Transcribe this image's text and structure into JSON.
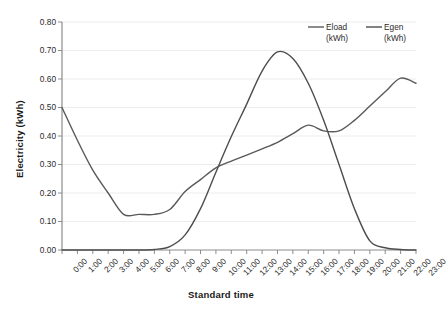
{
  "chart_data": {
    "type": "line",
    "title": "",
    "xlabel": "Standard time",
    "ylabel": "Electricity  (kWh)",
    "xlim": [
      0,
      23
    ],
    "ylim": [
      0.0,
      0.8
    ],
    "ytick_step": 0.1,
    "grid": true,
    "grid_axis": "y",
    "legend_position": "top-right",
    "categories": [
      "0:00",
      "1:00",
      "2:00",
      "3:00",
      "4:00",
      "5:00",
      "6:00",
      "7:00",
      "8:00",
      "9:00",
      "10:00",
      "11:00",
      "12:00",
      "13:00",
      "14:00",
      "15:00",
      "16:00",
      "17:00",
      "18:00",
      "19:00",
      "20:00",
      "21:00",
      "22:00",
      "23:00"
    ],
    "ytick_labels": [
      "0.00",
      "0.10",
      "0.20",
      "0.30",
      "0.40",
      "0.50",
      "0.60",
      "0.70",
      "0.80"
    ],
    "ytick_values": [
      0.0,
      0.1,
      0.2,
      0.3,
      0.4,
      0.5,
      0.6,
      0.7,
      0.8
    ],
    "series": [
      {
        "name": "Eload",
        "unit": "(kWh)",
        "color": "#595959",
        "values": [
          0.5,
          0.385,
          0.28,
          0.2,
          0.125,
          0.125,
          0.125,
          0.142,
          0.205,
          0.247,
          0.288,
          0.312,
          0.333,
          0.355,
          0.378,
          0.408,
          0.438,
          0.418,
          0.418,
          0.455,
          0.505,
          0.555,
          0.603,
          0.585
        ]
      },
      {
        "name": "Egen",
        "unit": "(kWh)",
        "color": "#4d4d4d",
        "values": [
          0.0,
          0.0,
          0.0,
          0.0,
          0.0,
          0.0,
          0.002,
          0.012,
          0.053,
          0.145,
          0.273,
          0.398,
          0.512,
          0.628,
          0.695,
          0.672,
          0.585,
          0.455,
          0.3,
          0.145,
          0.032,
          0.008,
          0.002,
          0.0
        ]
      }
    ]
  },
  "legend": {
    "entries": [
      {
        "label": "Eload",
        "unit": "(kWh)"
      },
      {
        "label": "Egen",
        "unit": "(kWh)"
      }
    ]
  }
}
